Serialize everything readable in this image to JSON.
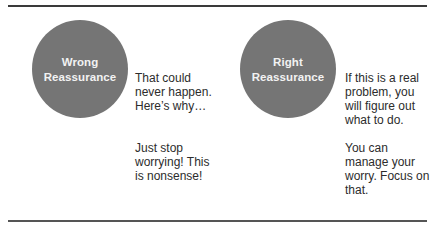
{
  "diagram": {
    "colors": {
      "circle_fill": "#757575",
      "circle_text": "#f2f2f2",
      "rule": "#3a3a3a",
      "body_text": "#2c2c2c"
    },
    "wrong": {
      "label_line1": "Wrong",
      "label_line2": "Reassurance",
      "examples": [
        "That could never happen. Here’s why…",
        "Just stop worrying! This is nonsense!"
      ]
    },
    "right": {
      "label_line1": "Right",
      "label_line2": "Reassurance",
      "examples": [
        "If this is a real problem, you will figure out what to do.",
        "You can manage your worry. Focus on that."
      ]
    }
  }
}
